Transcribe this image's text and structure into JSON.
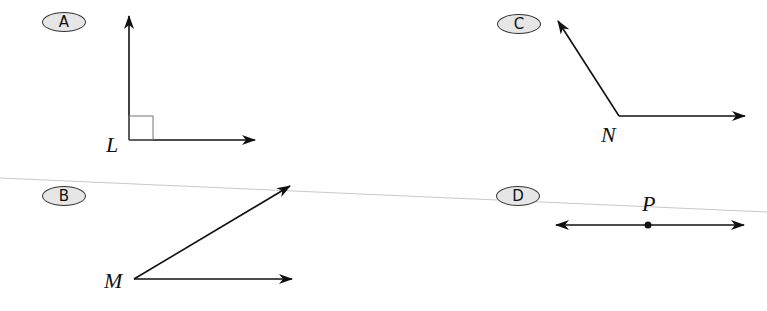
{
  "diagram": {
    "type": "geometry-angles-and-lines",
    "colors": {
      "stroke": "#111111",
      "badge_fill": "#e6e6e6",
      "badge_border": "#333333",
      "crease_line": "#c8c8c8"
    },
    "options": [
      {
        "letter": "A",
        "vertex_label": "L",
        "description": "right angle with square marker, rays up and right"
      },
      {
        "letter": "B",
        "vertex_label": "M",
        "description": "acute angle, rays up-right and right"
      },
      {
        "letter": "C",
        "vertex_label": "N",
        "description": "obtuse angle, rays up-left and right"
      },
      {
        "letter": "D",
        "vertex_label": "P",
        "description": "straight line through point P, arrows both ways"
      }
    ]
  }
}
